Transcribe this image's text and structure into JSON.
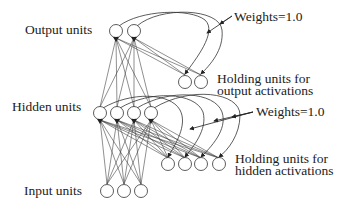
{
  "diagram": {
    "type": "simple-recurrent-network",
    "labels": {
      "output_units": "Output units",
      "hidden_units": "Hidden units",
      "input_units": "Input units",
      "weights_top": "Weights=1.0",
      "weights_bottom": "Weights=1.0",
      "holding_output_line1": "Holding units for",
      "holding_output_line2": "output activations",
      "holding_hidden_line1": "Holding units for",
      "holding_hidden_line2": "hidden activations"
    },
    "layers": {
      "output": {
        "count": 2
      },
      "output_holding": {
        "count": 2
      },
      "hidden": {
        "count": 4
      },
      "hidden_holding": {
        "count": 4
      },
      "input": {
        "count": 3
      }
    }
  }
}
